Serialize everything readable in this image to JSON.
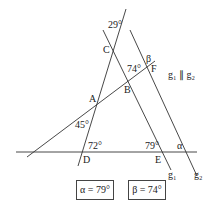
{
  "points": {
    "A": "A",
    "B": "B",
    "C": "C",
    "D": "D",
    "E": "E",
    "F": "F"
  },
  "angles": {
    "top": "29°",
    "mid": "74°",
    "left": "45°",
    "bottom_left": "72°",
    "bottom_right": "79°",
    "alpha": "α",
    "beta": "β"
  },
  "lines": {
    "g1": "g₁",
    "g2": "g₂"
  },
  "parallel_note": "g₁ ∥ g₂",
  "answers": {
    "alpha": "α = 79°",
    "beta": "β = 74°"
  }
}
